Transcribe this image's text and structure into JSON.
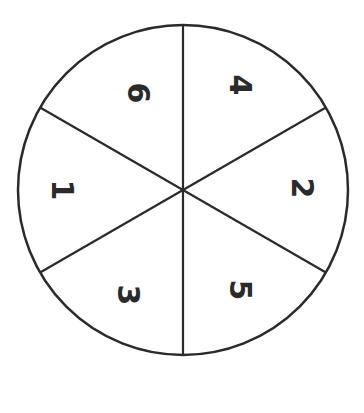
{
  "diagram": {
    "type": "spinner",
    "sector_count": 6,
    "colors": {
      "stroke": "#2a2a2a",
      "fill": "#ffffff",
      "label": "#2a2a2a"
    },
    "sectors": [
      {
        "label": "6",
        "position": "upper-left"
      },
      {
        "label": "4",
        "position": "upper-right"
      },
      {
        "label": "2",
        "position": "right"
      },
      {
        "label": "5",
        "position": "lower-right"
      },
      {
        "label": "3",
        "position": "lower-left"
      },
      {
        "label": "1",
        "position": "left"
      }
    ]
  }
}
